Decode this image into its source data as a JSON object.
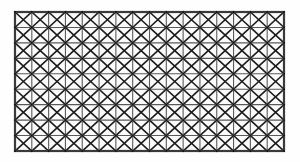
{
  "figure": {
    "name": "cross-braced-lattice-grid",
    "description": "Rectangular lattice grid with X cross-bracing in every cell",
    "caption": ""
  },
  "canvas": {
    "width": 300,
    "height": 162,
    "background_color": "#fefefe"
  },
  "grid": {
    "origin_x": 15,
    "origin_y": 12,
    "width": 269,
    "height": 139,
    "columns": 16,
    "rows": 9,
    "cell_width": 16.8125,
    "cell_height": 15.4444
  },
  "style": {
    "frame_color": "#3a3a3a",
    "frame_width": 2.2,
    "gridline_color": "#5a5a5a",
    "gridline_width": 1.1,
    "diagonal_color": "#1c1c1c",
    "diagonal_width": 1.6,
    "node_color": "#111111",
    "node_radius": 0.9,
    "cell_fill": "#fbfbfb"
  },
  "legend": {
    "member_types": [
      "vertical-chord",
      "horizontal-chord",
      "diagonal-brace-right",
      "diagonal-brace-left"
    ]
  },
  "chart_data": {
    "type": "diagram",
    "title": "",
    "columns": 16,
    "rows": 9,
    "cells": 144,
    "nodes": 170,
    "diagonals_per_cell": 2
  }
}
